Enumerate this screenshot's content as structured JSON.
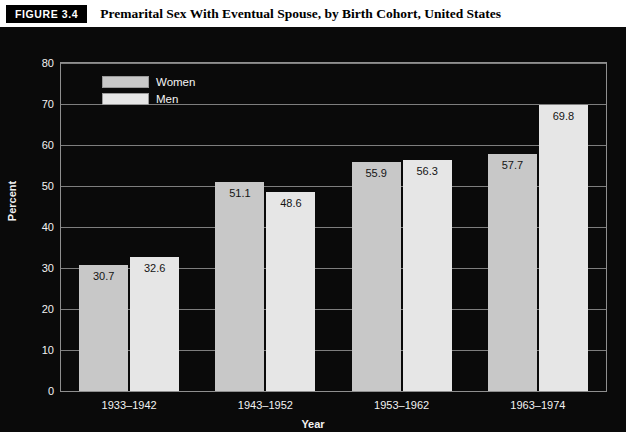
{
  "header": {
    "badge": "FIGURE 3.4",
    "title": "Premarital Sex With Eventual Spouse, by Birth Cohort, United States"
  },
  "colors": {
    "panel_background": "#0a0a0a",
    "women_bar": "#c8c8c8",
    "men_bar": "#e6e6e6",
    "grid": "#7e7e7e",
    "axis_text": "#f2f2f2",
    "label_text": "#141414"
  },
  "chart_data": {
    "type": "bar",
    "title": "Premarital Sex With Eventual Spouse, by Birth Cohort, United States",
    "xlabel": "Year",
    "ylabel": "Percent",
    "categories": [
      "1933–1942",
      "1943–1952",
      "1953–1962",
      "1963–1974"
    ],
    "series": [
      {
        "name": "Women",
        "values": [
          30.7,
          51.1,
          55.9,
          57.7
        ]
      },
      {
        "name": "Men",
        "values": [
          32.6,
          48.6,
          56.3,
          69.8
        ]
      }
    ],
    "ylim": [
      0,
      80
    ],
    "yticks": [
      0,
      10,
      20,
      30,
      40,
      50,
      60,
      70,
      80
    ],
    "ytick_labels": [
      "0",
      "10",
      "20",
      "30",
      "40",
      "50",
      "60",
      "70",
      "80"
    ],
    "data_labels": [
      "30.7",
      "32.6",
      "51.1",
      "48.6",
      "55.9",
      "56.3",
      "57.7",
      "69.8"
    ],
    "grid": true,
    "grid_axis": "y",
    "legend_position": "top-left",
    "legend": [
      "Women",
      "Men"
    ]
  }
}
